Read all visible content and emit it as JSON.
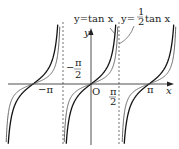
{
  "chart_data": {
    "type": "line",
    "title": "",
    "xlabel": "x",
    "ylabel": "y",
    "origin_label": "O",
    "series": [
      {
        "name": "y=tan x",
        "factor": 1,
        "color": "#111111",
        "width": 1.3
      },
      {
        "name": "y=1/2 tan x",
        "factor": 0.5,
        "color": "#555555",
        "width": 0.9
      }
    ],
    "x_ticks": [
      "-π",
      "-π/2",
      "π/2",
      "π"
    ],
    "asymptotes": [
      "-π/2",
      "π/2"
    ],
    "xlim": [
      -4.6,
      4.6
    ],
    "labels": {
      "tan": "y=tan x",
      "half_tan": "y=",
      "half_num": "1",
      "half_den": "2",
      "half_tail": "tan x"
    }
  }
}
